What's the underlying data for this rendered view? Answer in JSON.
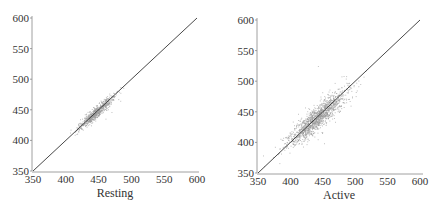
{
  "chart_data": [
    {
      "type": "scatter",
      "title": "",
      "xlabel": "Resting",
      "ylabel": "",
      "xlim": [
        350,
        600
      ],
      "ylim": [
        350,
        600
      ],
      "xticks": [
        350,
        400,
        450,
        500,
        550,
        600
      ],
      "yticks": [
        350,
        400,
        450,
        500,
        550,
        600
      ],
      "grid": false,
      "reference_line": {
        "from": [
          350,
          350
        ],
        "to": [
          600,
          600
        ],
        "label": "y = x"
      },
      "point_cloud": {
        "x_range": [
          405,
          495
        ],
        "center": [
          445,
          445
        ],
        "spread_along": 18,
        "spread_across": 3.5,
        "count": 700,
        "color": "#9a9a9a"
      }
    },
    {
      "type": "scatter",
      "title": "",
      "xlabel": "Active",
      "ylabel": "",
      "xlim": [
        350,
        600
      ],
      "ylim": [
        350,
        600
      ],
      "xticks": [
        350,
        400,
        450,
        500,
        550,
        600
      ],
      "yticks": [
        350,
        400,
        450,
        500,
        550,
        600
      ],
      "grid": false,
      "reference_line": {
        "from": [
          350,
          350
        ],
        "to": [
          600,
          600
        ],
        "label": "y = x"
      },
      "point_cloud": {
        "x_range": [
          355,
          580
        ],
        "center": [
          440,
          440
        ],
        "spread_along": 30,
        "spread_across": 7,
        "count": 1400,
        "color": "#9a9a9a"
      }
    }
  ],
  "panels": [
    {
      "xlabel": "Resting",
      "tick_labels": [
        "350",
        "400",
        "450",
        "500",
        "550",
        "600"
      ]
    },
    {
      "xlabel": "Active",
      "tick_labels": [
        "350",
        "400",
        "450",
        "500",
        "550",
        "600"
      ]
    }
  ]
}
